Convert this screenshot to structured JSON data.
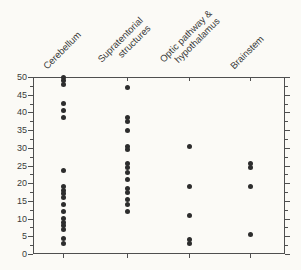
{
  "chart_data": {
    "type": "scatter",
    "subtype": "strip-plot",
    "title": "",
    "xlabel": "",
    "ylabel": "",
    "ylim": [
      0,
      50
    ],
    "yticks": [
      0,
      5,
      10,
      15,
      20,
      25,
      30,
      35,
      40,
      45,
      50
    ],
    "ytick_labels": [
      "0",
      "5",
      "10",
      "15",
      "20",
      "25",
      "30",
      "35",
      "40",
      "45",
      "50"
    ],
    "minor_tick_interval": 2.5,
    "grid": false,
    "legend": false,
    "dot_color": "#2d2d2d",
    "axis_color": "#4f4f4f",
    "background_color": "#fbfaf6",
    "categories": [
      {
        "label": "Cerebellum",
        "label_lines": [
          "Cerebellum"
        ],
        "values": [
          50,
          49,
          48,
          42.5,
          40.5,
          38.5,
          23.5,
          19,
          18,
          17,
          16,
          14,
          12,
          10,
          9,
          8,
          7,
          4.5,
          3
        ]
      },
      {
        "label": "Supratentorial structures",
        "label_lines": [
          "Supratentorial",
          "structures"
        ],
        "values": [
          47,
          38.5,
          37.5,
          35,
          30.5,
          29.5,
          25.5,
          24.5,
          23,
          21,
          18.5,
          17.5,
          15.5,
          14,
          12
        ]
      },
      {
        "label": "Optic pathway & hypothalamus",
        "label_lines": [
          "Optic pathway &",
          "hypothalamus"
        ],
        "values": [
          30.5,
          19,
          11,
          4,
          3
        ]
      },
      {
        "label": "Brainstem",
        "label_lines": [
          "Brainstem"
        ],
        "values": [
          25.5,
          24.5,
          19,
          5.5
        ]
      }
    ]
  }
}
